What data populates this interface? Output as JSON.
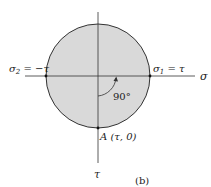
{
  "figure": {
    "type": "mohr-circle",
    "panel_label": "(b)",
    "colors": {
      "circle_fill": "#d9d9d9",
      "stroke": "#333333",
      "background": "#ffffff"
    },
    "axes": {
      "horizontal_label": "σ",
      "vertical_label": "τ"
    },
    "points": {
      "left": {
        "label_main": "σ",
        "label_sub": "2",
        "label_rest": " = −τ"
      },
      "right": {
        "label_main": "σ",
        "label_sub": "1",
        "label_rest": " = τ"
      },
      "bottom": {
        "label": "A (τ, 0)"
      }
    },
    "angle": {
      "label": "90°"
    }
  }
}
